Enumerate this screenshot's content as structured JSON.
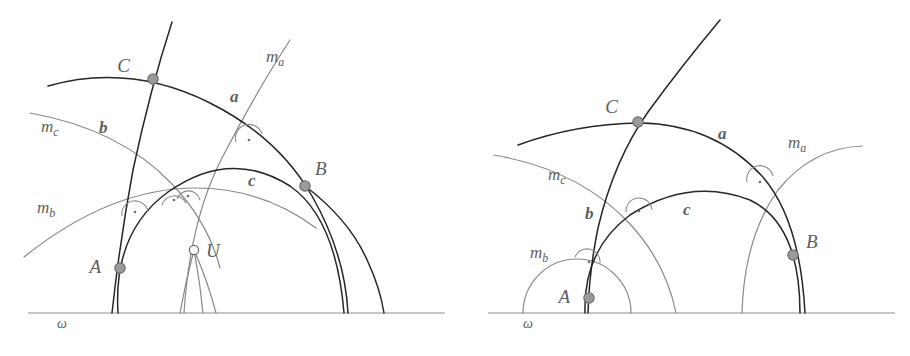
{
  "figure": {
    "background": "#ffffff",
    "side_stroke": "#262626",
    "bisector_stroke": "#888888",
    "boundary_stroke": "#b4b4b4",
    "point_fill": "#9a9a9a",
    "point_stroke": "#6a6a6a",
    "label_fill": "#5e5e5e"
  },
  "panels": [
    {
      "id": "left",
      "name": "circumcenter-exists",
      "boundary_label": "ω",
      "points": [
        {
          "id": "A",
          "label": "A",
          "type": "solid",
          "x": 120,
          "y": 268,
          "lx": 101,
          "ly": 273
        },
        {
          "id": "B",
          "label": "B",
          "type": "solid",
          "x": 305,
          "y": 186,
          "lx": 315,
          "ly": 175
        },
        {
          "id": "C",
          "label": "C",
          "type": "solid",
          "x": 153,
          "y": 79,
          "lx": 130,
          "ly": 72
        },
        {
          "id": "U",
          "label": "U",
          "type": "open",
          "x": 194,
          "y": 250,
          "lx": 206,
          "ly": 254
        }
      ],
      "side_labels": [
        {
          "id": "a",
          "label": "a",
          "x": 230,
          "y": 102
        },
        {
          "id": "b",
          "label": "b",
          "x": 99,
          "y": 133
        },
        {
          "id": "c",
          "label": "c",
          "x": 248,
          "y": 186
        }
      ],
      "bisector_labels": [
        {
          "id": "ma",
          "base": "m",
          "sub": "a",
          "x": 266,
          "y": 62
        },
        {
          "id": "mb",
          "base": "m",
          "sub": "b",
          "x": 37,
          "y": 213
        },
        {
          "id": "mc",
          "base": "m",
          "sub": "c",
          "x": 41,
          "y": 132
        }
      ],
      "right_angle_marks": 4,
      "omega_label_pos": {
        "x": 57,
        "y": 328
      }
    },
    {
      "id": "right",
      "name": "no-circumcenter",
      "boundary_label": "ω",
      "points": [
        {
          "id": "A",
          "label": "A",
          "type": "solid",
          "x": 589,
          "y": 298,
          "lx": 568,
          "ly": 303
        },
        {
          "id": "B",
          "label": "B",
          "type": "solid",
          "x": 793,
          "y": 255,
          "lx": 806,
          "ly": 248
        },
        {
          "id": "C",
          "label": "C",
          "type": "solid",
          "x": 638,
          "y": 122,
          "lx": 618,
          "ly": 113
        }
      ],
      "side_labels": [
        {
          "id": "a",
          "label": "a",
          "x": 718,
          "y": 139
        },
        {
          "id": "b",
          "label": "b",
          "x": 585,
          "y": 219
        },
        {
          "id": "c",
          "label": "c",
          "x": 683,
          "y": 215
        }
      ],
      "bisector_labels": [
        {
          "id": "ma",
          "base": "m",
          "sub": "a",
          "x": 788,
          "y": 148
        },
        {
          "id": "mb",
          "base": "m",
          "sub": "b",
          "x": 530,
          "y": 258
        },
        {
          "id": "mc",
          "base": "m",
          "sub": "c",
          "x": 548,
          "y": 180
        }
      ],
      "right_angle_marks": 3,
      "omega_label_pos": {
        "x": 523,
        "y": 328
      }
    }
  ]
}
